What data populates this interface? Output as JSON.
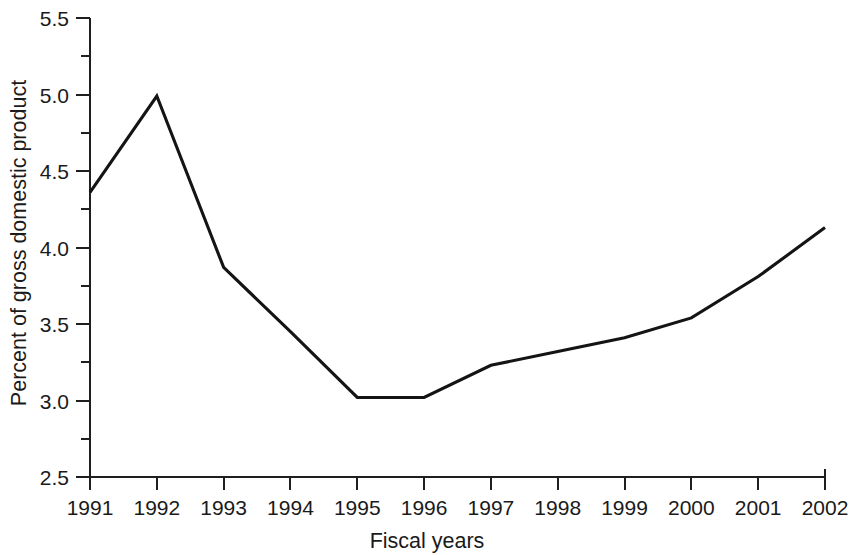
{
  "chart_data": {
    "type": "line",
    "title": "",
    "subtitle": "",
    "xlabel": "Fiscal years",
    "ylabel": "Percent of gross domestic product",
    "categories": [
      "1991",
      "1992",
      "1993",
      "1994",
      "1995",
      "1996",
      "1997",
      "1998",
      "1999",
      "2000",
      "2001",
      "2002"
    ],
    "x": [
      1991,
      1992,
      1993,
      1994,
      1995,
      1996,
      1997,
      1998,
      1999,
      2000,
      2001,
      2002
    ],
    "values": [
      4.36,
      4.99,
      3.87,
      3.45,
      3.02,
      3.02,
      3.23,
      3.32,
      3.41,
      3.54,
      3.81,
      4.13
    ],
    "series": [
      {
        "name": "Percent of gross domestic product",
        "values": [
          4.36,
          4.99,
          3.87,
          3.45,
          3.02,
          3.02,
          3.23,
          3.32,
          3.41,
          3.54,
          3.81,
          4.13
        ]
      }
    ],
    "ylim": [
      2.5,
      5.5
    ],
    "xlim": [
      1991,
      2002
    ],
    "y_major_ticks": [
      2.5,
      3.0,
      3.5,
      4.0,
      4.5,
      5.0,
      5.5
    ],
    "y_tick_labels": [
      "2.5",
      "3.0",
      "3.5",
      "4.0",
      "4.5",
      "5.0",
      "5.5"
    ],
    "y_minor_ticks": [
      2.75,
      3.25,
      3.75,
      4.25,
      4.75,
      5.25
    ],
    "grid": false,
    "legend": false,
    "legend_position": "none",
    "line_color": "#141414",
    "axis_color": "#1f1f1f",
    "background_color": "#ffffff",
    "annotations": []
  }
}
